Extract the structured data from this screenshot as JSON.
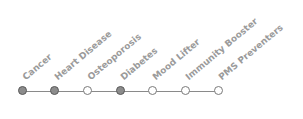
{
  "diagram": {
    "steps": [
      {
        "label": "Cancer",
        "x": 22,
        "state": "filled"
      },
      {
        "label": "Heart Disease",
        "x": 54,
        "state": "filled"
      },
      {
        "label": "Osteoporosis",
        "x": 87,
        "state": "empty"
      },
      {
        "label": "Diabetes",
        "x": 120,
        "state": "filled"
      },
      {
        "label": "Mood Lifter",
        "x": 152,
        "state": "empty"
      },
      {
        "label": "Immunity Booster",
        "x": 185,
        "state": "empty"
      },
      {
        "label": "PMS Preventers",
        "x": 218,
        "state": "empty"
      }
    ],
    "colors": {
      "filled": "#8c8c8c",
      "empty": "#ffffff",
      "line": "#8a8a8a",
      "label": "#9a9a9a"
    }
  }
}
